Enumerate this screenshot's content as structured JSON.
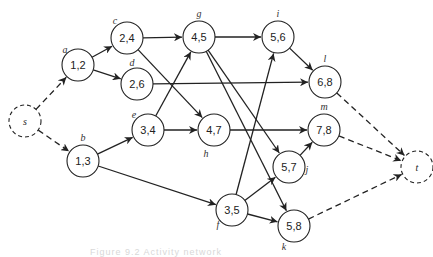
{
  "diagram": {
    "type": "activity-network",
    "nodes": [
      {
        "id": "s",
        "label": "s",
        "value": "s",
        "x": 25,
        "y": 121,
        "dashed": true
      },
      {
        "id": "a",
        "label": "a",
        "value": "1,2",
        "x": 78,
        "y": 65,
        "label_dx": -13,
        "label_dy": -12
      },
      {
        "id": "b",
        "label": "b",
        "value": "1,3",
        "x": 83,
        "y": 161,
        "label_dx": 0,
        "label_dy": -20
      },
      {
        "id": "c",
        "label": "c",
        "value": "2,4",
        "x": 127,
        "y": 38,
        "label_dx": -12,
        "label_dy": -14
      },
      {
        "id": "d",
        "label": "d",
        "value": "2,6",
        "x": 137,
        "y": 84,
        "label_dx": -5,
        "label_dy": -18
      },
      {
        "id": "e",
        "label": "e",
        "value": "3,4",
        "x": 148,
        "y": 130,
        "label_dx": -14,
        "label_dy": -12
      },
      {
        "id": "g",
        "label": "g",
        "value": "4,5",
        "x": 199,
        "y": 37,
        "label_dx": 0,
        "label_dy": -20
      },
      {
        "id": "h",
        "label": "h",
        "value": "4,7",
        "x": 214,
        "y": 130,
        "label_dx": -8,
        "label_dy": 27
      },
      {
        "id": "i",
        "label": "i",
        "value": "5,6",
        "x": 278,
        "y": 37,
        "label_dx": 0,
        "label_dy": -20
      },
      {
        "id": "l",
        "label": "l",
        "value": "6,8",
        "x": 325,
        "y": 82,
        "label_dx": 0,
        "label_dy": -20
      },
      {
        "id": "m",
        "label": "m",
        "value": "7,8",
        "x": 324,
        "y": 130,
        "label_dx": 0,
        "label_dy": -20
      },
      {
        "id": "j",
        "label": "j",
        "value": "5,7",
        "x": 289,
        "y": 167,
        "label_dx": 18,
        "label_dy": 6
      },
      {
        "id": "f",
        "label": "f",
        "value": "3,5",
        "x": 232,
        "y": 210,
        "label_dx": -14,
        "label_dy": 18
      },
      {
        "id": "k",
        "label": "k",
        "value": "5,8",
        "x": 294,
        "y": 226,
        "label_dx": -10,
        "label_dy": 24
      },
      {
        "id": "t",
        "label": "t",
        "value": "t",
        "x": 417,
        "y": 167,
        "dashed": true
      }
    ],
    "edges": [
      {
        "from": "s",
        "to": "a",
        "dashed": true
      },
      {
        "from": "s",
        "to": "b",
        "dashed": true
      },
      {
        "from": "a",
        "to": "c"
      },
      {
        "from": "a",
        "to": "d"
      },
      {
        "from": "b",
        "to": "e"
      },
      {
        "from": "b",
        "to": "f"
      },
      {
        "from": "c",
        "to": "g"
      },
      {
        "from": "c",
        "to": "h"
      },
      {
        "from": "d",
        "to": "l"
      },
      {
        "from": "e",
        "to": "g"
      },
      {
        "from": "e",
        "to": "h"
      },
      {
        "from": "g",
        "to": "i"
      },
      {
        "from": "g",
        "to": "j"
      },
      {
        "from": "g",
        "to": "k"
      },
      {
        "from": "h",
        "to": "m"
      },
      {
        "from": "i",
        "to": "l"
      },
      {
        "from": "f",
        "to": "i"
      },
      {
        "from": "f",
        "to": "j"
      },
      {
        "from": "f",
        "to": "k"
      },
      {
        "from": "j",
        "to": "m"
      },
      {
        "from": "l",
        "to": "t",
        "dashed": true
      },
      {
        "from": "m",
        "to": "t",
        "dashed": true
      },
      {
        "from": "k",
        "to": "t",
        "dashed": true
      }
    ]
  },
  "caption": "Figure 9.2  Activity network"
}
